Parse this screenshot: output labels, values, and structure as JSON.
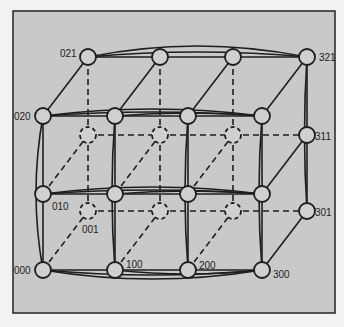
{
  "figure": {
    "background": "#c9c9c9",
    "frame_color": "#222222",
    "node_fill": "#d0d0d0",
    "stroke": "#1e1e1e"
  },
  "grid": {
    "x_dim": 4,
    "y_dim": 3,
    "z_dim": 2
  },
  "labels": [
    {
      "id": "000",
      "text": "000"
    },
    {
      "id": "010",
      "text": "010"
    },
    {
      "id": "020",
      "text": "020"
    },
    {
      "id": "021",
      "text": "021"
    },
    {
      "id": "001",
      "text": "001"
    },
    {
      "id": "100",
      "text": "100"
    },
    {
      "id": "200",
      "text": "200"
    },
    {
      "id": "300",
      "text": "300"
    },
    {
      "id": "301",
      "text": "301"
    },
    {
      "id": "311",
      "text": "311"
    },
    {
      "id": "321",
      "text": "321"
    }
  ]
}
